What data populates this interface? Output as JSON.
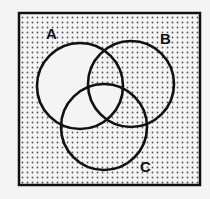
{
  "diagram": {
    "type": "venn-3-set",
    "frame": {
      "x": 19,
      "y": 13,
      "width": 181,
      "height": 172,
      "border_color": "#111111",
      "border_width": 2.5
    },
    "background_color": "#f4f4f4",
    "dot_color": "#555555",
    "line_color": "#111111",
    "sets": [
      {
        "name": "A",
        "label": "A",
        "cx": 80,
        "cy": 86,
        "r": 43,
        "label_x": 46,
        "label_y": 39
      },
      {
        "name": "B",
        "label": "B",
        "cx": 131,
        "cy": 84,
        "r": 43,
        "label_x": 160,
        "label_y": 44
      },
      {
        "name": "C",
        "label": "C",
        "cx": 104,
        "cy": 127,
        "r": 43,
        "label_x": 140,
        "label_y": 172
      }
    ],
    "shading": {
      "unshaded_regions": [
        "A only",
        "A∩C only",
        "A∩B∩C"
      ],
      "shaded_regions": [
        "outside all sets",
        "B only",
        "C only",
        "A∩B only",
        "B∩C only"
      ],
      "unshaded_fill": "#f4f4f4",
      "pattern": "dots"
    }
  }
}
